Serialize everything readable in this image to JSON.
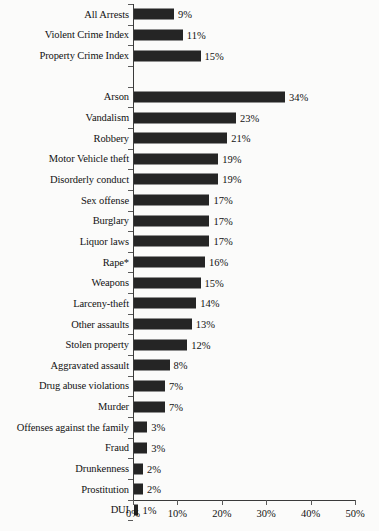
{
  "chart_data": {
    "type": "bar",
    "orientation": "horizontal",
    "title": "",
    "subtitle": "",
    "xlabel": "",
    "ylabel": "",
    "xlim": [
      0,
      50
    ],
    "grid": false,
    "legend": false,
    "value_suffix": "%",
    "bar_color": "#252525",
    "background_color": "#fbfbfa",
    "text_color": "#121212",
    "axis_color": "#3a3a3a",
    "xticks": [
      0,
      10,
      20,
      30,
      40,
      50
    ],
    "xtick_labels": [
      "0%",
      "10%",
      "20%",
      "30%",
      "40%",
      "50%"
    ],
    "categories": [
      "All Arrests",
      "Violent Crime Index",
      "Property Crime Index",
      "",
      "Arson",
      "Vandalism",
      "Robbery",
      "Motor Vehicle theft",
      "Disorderly conduct",
      "Sex offense",
      "Burglary",
      "Liquor laws",
      "Rape*",
      "Weapons",
      "Larceny-theft",
      "Other assaults",
      "Stolen property",
      "Aggravated assault",
      "Drug abuse violations",
      "Murder",
      "Offenses against the family",
      "Fraud",
      "Drunkenness",
      "Prostitution",
      "DUI"
    ],
    "values": [
      9,
      11,
      15,
      null,
      34,
      23,
      21,
      19,
      19,
      17,
      17,
      17,
      16,
      15,
      14,
      13,
      12,
      8,
      7,
      7,
      3,
      3,
      2,
      2,
      1
    ],
    "value_labels": [
      "9%",
      "11%",
      "15%",
      "",
      "34%",
      "23%",
      "21%",
      "19%",
      "19%",
      "17%",
      "17%",
      "17%",
      "16%",
      "15%",
      "14%",
      "13%",
      "12%",
      "8%",
      "7%",
      "7%",
      "3%",
      "3%",
      "2%",
      "2%",
      "1%"
    ],
    "annotations": [
      "Rape* denotes forcible rape"
    ]
  }
}
